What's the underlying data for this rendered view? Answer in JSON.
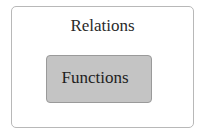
{
  "diagram": {
    "type": "nested-sets",
    "outer": {
      "label": "Relations",
      "fill": "#ffffff",
      "border": "#b8b8b8"
    },
    "inner": {
      "label": "Functions",
      "fill": "#c4c4c4",
      "border": "#9a9a9a"
    }
  }
}
